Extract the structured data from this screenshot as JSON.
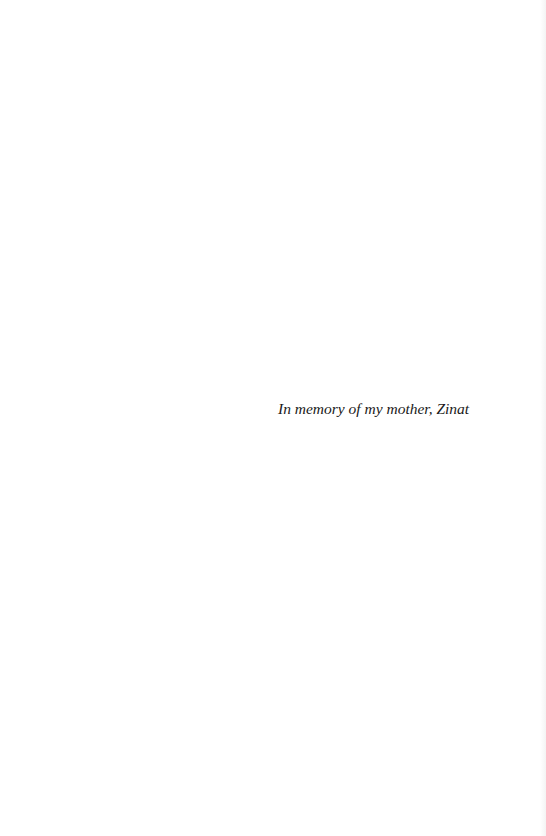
{
  "page": {
    "dedication": "In memory of my mother, Zinat"
  }
}
